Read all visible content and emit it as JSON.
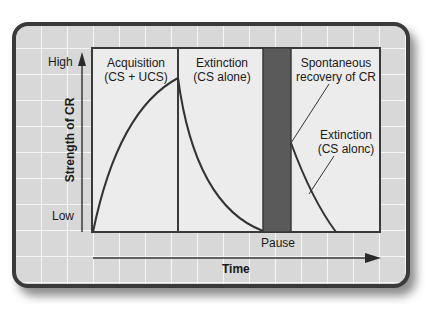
{
  "diagram": {
    "type": "classical-conditioning-phases",
    "y_axis": {
      "label": "Strength of CR",
      "high_label": "High",
      "low_label": "Low"
    },
    "x_axis": {
      "label": "Time"
    },
    "phases": [
      {
        "id": "acquisition",
        "title_line1": "Acquisition",
        "title_line2": "(CS + UCS)"
      },
      {
        "id": "extinction",
        "title_line1": "Extinction",
        "title_line2": "(CS alone)"
      },
      {
        "id": "pause",
        "label": "Pause"
      },
      {
        "id": "spontaneous-recovery",
        "title_line1": "Spontaneous",
        "title_line2": "recovery of CR"
      }
    ],
    "annotations": {
      "second_extinction_line1": "Extinction",
      "second_extinction_line2": "(CS alonc)"
    },
    "colors": {
      "panel_bg": "#d8d8d8",
      "panel_border": "#3a3a3a",
      "chart_bg": "#ececec",
      "pause_bar": "#5a5a5a",
      "curve": "#333333",
      "text": "#1a1a1a"
    }
  }
}
